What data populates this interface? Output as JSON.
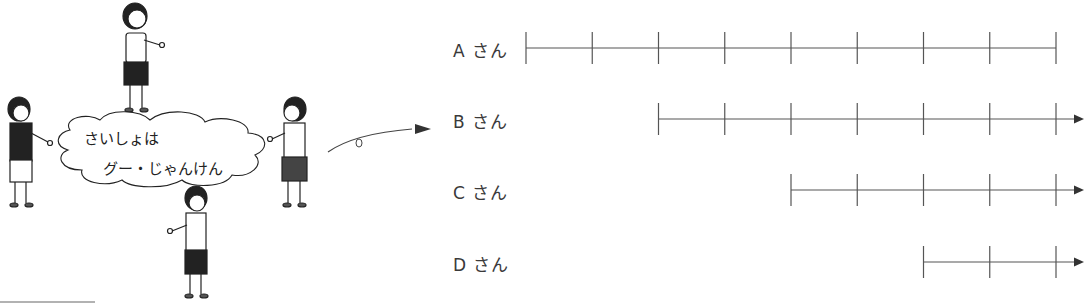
{
  "scene": {
    "speech_line1": "さいしょは",
    "speech_line2": "グー・じゃんけん",
    "children_count": 4
  },
  "diagram": {
    "rows": [
      {
        "label": "A さん",
        "start_tick": 0,
        "end_tick": 8,
        "arrow": false
      },
      {
        "label": "B さん",
        "start_tick": 2,
        "end_tick": 8,
        "arrow": true
      },
      {
        "label": "C さん",
        "start_tick": 4,
        "end_tick": 8,
        "arrow": true
      },
      {
        "label": "D さん",
        "start_tick": 6,
        "end_tick": 8,
        "arrow": true
      }
    ],
    "tick_count": 9,
    "line_color": "#555555"
  }
}
